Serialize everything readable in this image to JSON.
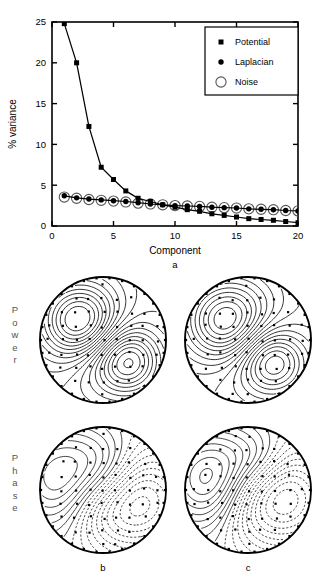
{
  "figure": {
    "panel_a_letter": "a",
    "panel_b_letter": "b",
    "panel_c_letter": "c",
    "row_label_power": "Power",
    "row_label_phase": "Phase"
  },
  "chart_data": {
    "type": "line",
    "title": "",
    "xlabel": "Component",
    "ylabel": "% variance",
    "xlim": [
      0,
      20
    ],
    "ylim": [
      0,
      25
    ],
    "xticks": [
      0,
      5,
      10,
      15,
      20
    ],
    "yticks": [
      0,
      5,
      10,
      15,
      20,
      25
    ],
    "grid": false,
    "legend_position": "top-right",
    "x": [
      1,
      2,
      3,
      4,
      5,
      6,
      7,
      8,
      9,
      10,
      11,
      12,
      13,
      14,
      15,
      16,
      17,
      18,
      19,
      20
    ],
    "series": [
      {
        "name": "Potential",
        "marker": "filled-square",
        "values": [
          24.8,
          20.0,
          12.2,
          7.2,
          5.7,
          4.3,
          3.4,
          3.0,
          2.6,
          2.3,
          2.0,
          1.8,
          1.5,
          1.3,
          1.1,
          0.9,
          0.8,
          0.7,
          0.55,
          0.4
        ]
      },
      {
        "name": "Laplacian",
        "marker": "filled-circle",
        "values": [
          3.7,
          3.45,
          3.3,
          3.2,
          3.1,
          3.0,
          2.85,
          2.7,
          2.6,
          2.5,
          2.45,
          2.4,
          2.3,
          2.25,
          2.2,
          2.1,
          2.05,
          2.0,
          1.9,
          1.85
        ]
      },
      {
        "name": "Noise",
        "marker": "open-circle",
        "values": [
          3.55,
          3.4,
          3.25,
          3.15,
          3.05,
          2.95,
          2.8,
          2.7,
          2.6,
          2.5,
          2.45,
          2.4,
          2.3,
          2.25,
          2.2,
          2.1,
          2.05,
          2.0,
          1.9,
          1.85
        ]
      }
    ]
  },
  "legend": {
    "items": [
      {
        "label": "Potential",
        "marker": "filled-square"
      },
      {
        "label": "Laplacian",
        "marker": "filled-circle"
      },
      {
        "label": "Noise",
        "marker": "open-circle"
      }
    ]
  },
  "headmaps": [
    {
      "id": "power-b",
      "row": "Power",
      "column": "b",
      "measure": "Power"
    },
    {
      "id": "power-c",
      "row": "Power",
      "column": "c",
      "measure": "Power"
    },
    {
      "id": "phase-b",
      "row": "Phase",
      "column": "b",
      "measure": "Phase"
    },
    {
      "id": "phase-c",
      "row": "Phase",
      "column": "c",
      "measure": "Phase"
    }
  ],
  "colors": {
    "ink": "#000000",
    "background": "#ffffff",
    "row_label": "#555555"
  }
}
